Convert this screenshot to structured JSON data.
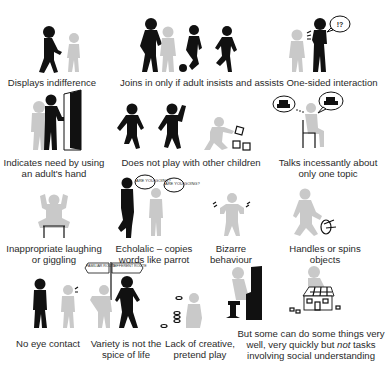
{
  "panels": [
    {
      "id": "indifference",
      "caption_lines": [
        "Displays indifference"
      ]
    },
    {
      "id": "joins-if-adult-insists",
      "caption_lines": [
        "Joins in only if adult insists and assists"
      ]
    },
    {
      "id": "one-sided",
      "caption_lines": [
        "One-sided interaction"
      ],
      "bubble": "!?"
    },
    {
      "id": "adult-hand",
      "caption_lines": [
        "Indicates need by using",
        "an adult's hand"
      ]
    },
    {
      "id": "no-play",
      "caption_lines": [
        "Does not play with other children"
      ]
    },
    {
      "id": "one-topic",
      "caption_lines": [
        "Talks incessantly about",
        "only one topic"
      ]
    },
    {
      "id": "laughing",
      "caption_lines": [
        "Inappropriate laughing",
        "or giggling"
      ]
    },
    {
      "id": "echolalic",
      "caption_lines": [
        "Echolalic – copies",
        "words like parrot"
      ],
      "bubbles": [
        "ARE YOU GOING?",
        "ARE YOU GOING?"
      ]
    },
    {
      "id": "bizarre",
      "caption_lines": [
        "Bizarre",
        "behaviour"
      ]
    },
    {
      "id": "spins-objects",
      "caption_lines": [
        "Handles or spins",
        "objects"
      ]
    },
    {
      "id": "no-eye-contact",
      "caption_lines": [
        "No eye contact"
      ]
    },
    {
      "id": "variety",
      "caption_lines": [
        "Variety is not the",
        "spice of life"
      ],
      "signs": [
        "FAMILIAR ROUTE",
        "DIFFERENT ROUTE"
      ]
    },
    {
      "id": "pretend-play",
      "caption_lines": [
        "Lack of creative,",
        "pretend play"
      ]
    },
    {
      "id": "skills",
      "caption_lines": [
        "But some can do some things very",
        "well, very quickly but ",
        "not",
        " tasks",
        "involving social understanding"
      ]
    }
  ]
}
